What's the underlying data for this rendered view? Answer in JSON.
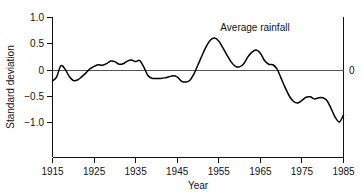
{
  "chart_data": {
    "type": "line",
    "title": "",
    "xlabel": "Year",
    "ylabel": "Standard deviation",
    "xlim": [
      1915,
      1985
    ],
    "ylim": [
      -1.25,
      1.0
    ],
    "grid": false,
    "legend": "none",
    "annotations": [
      {
        "text": "Average rainfall",
        "x": 1958,
        "y": 0.82
      }
    ],
    "zero_reference_line": 0,
    "right_axis_label": "0",
    "xticks": [
      1915,
      1925,
      1935,
      1945,
      1955,
      1965,
      1975,
      1985
    ],
    "xtick_labels": [
      "1915",
      "1925",
      "1935",
      "1945",
      "1955",
      "1965",
      "1975",
      "1985"
    ],
    "yticks": [
      1.0,
      0.5,
      0,
      -0.5,
      -1.0
    ],
    "ytick_labels": [
      "1.0",
      "0.5",
      "0",
      "−0.5",
      "−1.0"
    ],
    "series": [
      {
        "name": "Average rainfall standard deviation",
        "x": [
          1915,
          1916,
          1917,
          1918,
          1919,
          1920,
          1921,
          1922,
          1923,
          1924,
          1925,
          1926,
          1927,
          1928,
          1929,
          1930,
          1931,
          1932,
          1933,
          1934,
          1935,
          1936,
          1937,
          1938,
          1939,
          1940,
          1941,
          1942,
          1943,
          1944,
          1945,
          1946,
          1947,
          1948,
          1949,
          1950,
          1951,
          1952,
          1953,
          1954,
          1955,
          1956,
          1957,
          1958,
          1959,
          1960,
          1961,
          1962,
          1963,
          1964,
          1965,
          1966,
          1967,
          1968,
          1969,
          1970,
          1971,
          1972,
          1973,
          1974,
          1975,
          1976,
          1977,
          1978,
          1979,
          1980,
          1981,
          1982,
          1983,
          1984,
          1985
        ],
        "values": [
          -0.21,
          -0.13,
          0.08,
          0.02,
          -0.12,
          -0.2,
          -0.19,
          -0.13,
          -0.06,
          0.02,
          0.07,
          0.1,
          0.09,
          0.12,
          0.17,
          0.16,
          0.11,
          0.12,
          0.17,
          0.19,
          0.16,
          0.18,
          0.05,
          -0.11,
          -0.16,
          -0.16,
          -0.16,
          -0.15,
          -0.13,
          -0.11,
          -0.13,
          -0.21,
          -0.23,
          -0.2,
          -0.08,
          0.1,
          0.28,
          0.45,
          0.57,
          0.61,
          0.55,
          0.42,
          0.28,
          0.15,
          0.07,
          0.06,
          0.12,
          0.25,
          0.34,
          0.38,
          0.32,
          0.18,
          0.11,
          0.1,
          0.02,
          -0.16,
          -0.34,
          -0.5,
          -0.6,
          -0.63,
          -0.58,
          -0.52,
          -0.51,
          -0.55,
          -0.53,
          -0.53,
          -0.58,
          -0.73,
          -0.9,
          -0.99,
          -0.86
        ]
      }
    ]
  }
}
